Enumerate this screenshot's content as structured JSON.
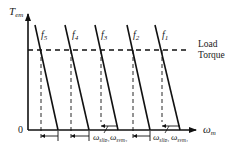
{
  "diagram": {
    "y_axis": {
      "label": "T",
      "label_sub": "em"
    },
    "x_axis": {
      "label": "ω",
      "label_sub": "m"
    },
    "origin_label": "0",
    "load_torque": {
      "line1": "Load",
      "line2": "Torque"
    },
    "curves": [
      {
        "label": "f",
        "sub": "5"
      },
      {
        "label": "f",
        "sub": "4"
      },
      {
        "label": "f",
        "sub": "3"
      },
      {
        "label": "f",
        "sub": "2"
      },
      {
        "label": "f",
        "sub": "1"
      }
    ],
    "bottom_labels": [
      {
        "text": "ω",
        "sub": "slip",
        "subsub": "3"
      },
      {
        "text": "ω",
        "sub": "sym",
        "subsub": "3"
      },
      {
        "text": "ω",
        "sub": "slip",
        "subsub": "1"
      },
      {
        "text": "ω",
        "sub": "sym",
        "subsub": "1"
      }
    ]
  }
}
